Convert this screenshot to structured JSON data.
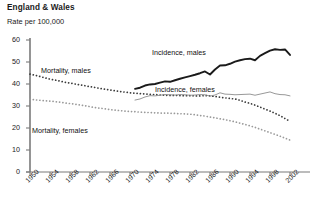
{
  "header": {
    "title": "England & Wales",
    "unit_label": "Rate per 100,000"
  },
  "colors": {
    "incidence_males": "#1a1a1a",
    "incidence_females": "#8c8c8c",
    "mortality_males": "#3a3a3a",
    "mortality_females": "#9a9a9a",
    "axis": "#7a7a7a",
    "text": "#1a1a1a",
    "background": "#ffffff"
  },
  "chart_data": {
    "type": "line",
    "title": "England & Wales",
    "subtitle": "",
    "xlabel": "",
    "ylabel": "Rate per 100,000",
    "xlim": [
      1950,
      2003
    ],
    "ylim": [
      0,
      60
    ],
    "ytick_labels": [
      "60",
      "50",
      "40",
      "30",
      "20",
      "10",
      "0"
    ],
    "yticks": [
      60,
      50,
      40,
      30,
      20,
      10,
      0
    ],
    "xtick_labels": [
      "1950",
      "1954",
      "1958",
      "1962",
      "1966",
      "1970",
      "1974",
      "1978",
      "1982",
      "1986",
      "1990",
      "1994",
      "1998",
      "2002"
    ],
    "xticks": [
      1950,
      1954,
      1958,
      1962,
      1966,
      1970,
      1974,
      1978,
      1982,
      1986,
      1990,
      1994,
      1998,
      2002
    ],
    "grid": false,
    "legend": "inline-annotations",
    "series": [
      {
        "name": "Mortality, males",
        "style": "dotted",
        "color": "#3a3a3a",
        "label_position": "upper-left",
        "x": [
          1950,
          1951,
          1952,
          1953,
          1954,
          1955,
          1956,
          1957,
          1958,
          1959,
          1960,
          1961,
          1962,
          1963,
          1964,
          1965,
          1966,
          1967,
          1968,
          1969,
          1970,
          1971,
          1972,
          1973,
          1974,
          1975,
          1976,
          1977,
          1978,
          1979,
          1980,
          1981,
          1982,
          1983,
          1984,
          1985,
          1986,
          1987,
          1988,
          1989,
          1990,
          1991,
          1992,
          1993,
          1994,
          1995,
          1996,
          1997,
          1998,
          1999,
          2000,
          2001,
          2002
        ],
        "values": [
          44.5,
          44.0,
          43.4,
          42.8,
          42.2,
          41.8,
          41.3,
          40.8,
          40.4,
          40.0,
          39.6,
          39.2,
          38.8,
          38.4,
          38.0,
          37.6,
          37.3,
          36.9,
          36.6,
          36.3,
          36.0,
          35.8,
          35.6,
          35.5,
          35.3,
          35.2,
          35.0,
          34.9,
          34.8,
          34.8,
          34.7,
          34.7,
          34.7,
          34.6,
          34.6,
          34.7,
          34.6,
          34.3,
          34.0,
          33.7,
          33.4,
          33.2,
          32.6,
          31.8,
          31.2,
          30.4,
          29.5,
          28.6,
          27.7,
          26.7,
          25.6,
          24.3,
          23.0
        ]
      },
      {
        "name": "Mortality, females",
        "style": "dotted",
        "color": "#9a9a9a",
        "label_position": "lower-left",
        "x": [
          1950,
          1951,
          1952,
          1953,
          1954,
          1955,
          1956,
          1957,
          1958,
          1959,
          1960,
          1961,
          1962,
          1963,
          1964,
          1965,
          1966,
          1967,
          1968,
          1969,
          1970,
          1971,
          1972,
          1973,
          1974,
          1975,
          1976,
          1977,
          1978,
          1979,
          1980,
          1981,
          1982,
          1983,
          1984,
          1985,
          1986,
          1987,
          1988,
          1989,
          1990,
          1991,
          1992,
          1993,
          1994,
          1995,
          1996,
          1997,
          1998,
          1999,
          2000,
          2001,
          2002
        ],
        "values": [
          33.0,
          32.8,
          32.6,
          32.4,
          32.2,
          32.0,
          31.7,
          31.4,
          31.1,
          30.8,
          30.5,
          30.1,
          29.7,
          29.3,
          29.0,
          28.7,
          28.4,
          28.1,
          27.9,
          27.7,
          27.5,
          27.4,
          27.2,
          27.1,
          27.0,
          26.9,
          26.8,
          26.8,
          26.7,
          26.6,
          26.5,
          26.4,
          26.3,
          26.0,
          25.7,
          25.4,
          25.0,
          24.6,
          24.2,
          23.8,
          23.3,
          22.8,
          22.2,
          21.6,
          21.0,
          20.3,
          19.5,
          18.7,
          17.9,
          17.1,
          16.3,
          15.4,
          14.5
        ]
      },
      {
        "name": "Incidence, males",
        "style": "solid-thick",
        "color": "#1a1a1a",
        "label_position": "upper-right",
        "x": [
          1971,
          1972,
          1973,
          1974,
          1975,
          1976,
          1977,
          1978,
          1979,
          1980,
          1981,
          1982,
          1983,
          1984,
          1985,
          1986,
          1987,
          1988,
          1989,
          1990,
          1991,
          1992,
          1993,
          1994,
          1995,
          1996,
          1997,
          1998,
          1999,
          2000,
          2001,
          2002
        ],
        "values": [
          37.8,
          38.3,
          39.3,
          39.8,
          40.0,
          40.6,
          41.2,
          41.0,
          41.7,
          42.4,
          43.0,
          43.6,
          44.2,
          44.9,
          45.7,
          44.3,
          46.6,
          48.4,
          48.5,
          49.2,
          50.2,
          50.8,
          51.3,
          51.5,
          50.8,
          52.8,
          54.0,
          55.2,
          55.8,
          55.5,
          55.7,
          53.2
        ]
      },
      {
        "name": "Incidence, females",
        "style": "solid-thin",
        "color": "#8c8c8c",
        "label_position": "middle-right",
        "x": [
          1971,
          1972,
          1973,
          1974,
          1975,
          1976,
          1977,
          1978,
          1979,
          1980,
          1981,
          1982,
          1983,
          1984,
          1985,
          1986,
          1987,
          1988,
          1989,
          1990,
          1991,
          1992,
          1993,
          1994,
          1995,
          1996,
          1997,
          1998,
          1999,
          2000,
          2001,
          2002
        ],
        "values": [
          32.7,
          33.2,
          34.1,
          34.7,
          34.6,
          34.9,
          35.2,
          35.1,
          35.0,
          35.2,
          35.1,
          34.9,
          35.0,
          35.2,
          35.1,
          34.5,
          35.0,
          36.0,
          35.4,
          35.3,
          35.1,
          35.2,
          35.3,
          35.4,
          34.9,
          35.4,
          35.9,
          36.4,
          35.6,
          35.2,
          35.1,
          34.6
        ]
      }
    ]
  }
}
